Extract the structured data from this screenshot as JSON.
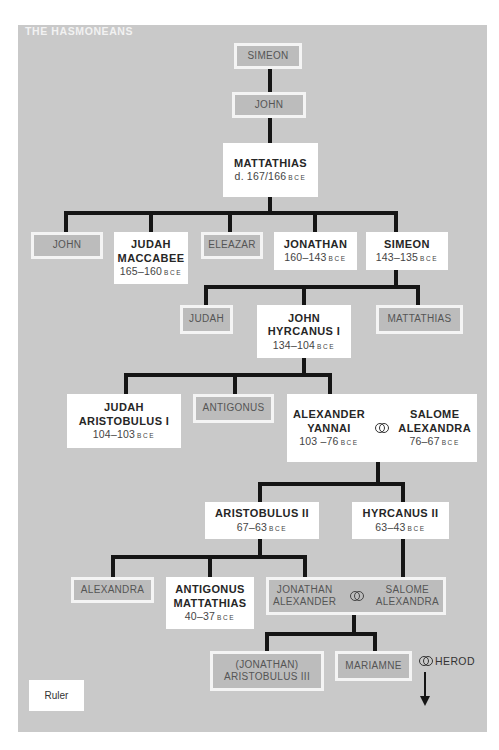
{
  "title": "THE HASMONEANS",
  "era_suffix": "BCE",
  "marriage_symbol": "interlocked-rings",
  "colors": {
    "background": "#c9c9c9",
    "ruler_box": "#ffffff",
    "non_ruler_box": "#bcbcbc",
    "line": "#151515"
  },
  "legend": {
    "ruler_label": "Ruler"
  },
  "nodes": {
    "simeon_top": {
      "name": "SIMEON",
      "ruler": false
    },
    "john_top": {
      "name": "JOHN",
      "ruler": false
    },
    "mattathias": {
      "name": "MATTATHIAS",
      "date": "d. 167/166",
      "ruler": true
    },
    "john_son": {
      "name": "JOHN",
      "ruler": false
    },
    "judah_maccabee": {
      "name1": "JUDAH",
      "name2": "MACCABEE",
      "date": "165–160",
      "ruler": true
    },
    "eleazar": {
      "name": "ELEAZAR",
      "ruler": false
    },
    "jonathan": {
      "name": "JONATHAN",
      "date": "160–143",
      "ruler": true
    },
    "simeon": {
      "name": "SIMEON",
      "date": "143–135",
      "ruler": true
    },
    "judah_son": {
      "name": "JUDAH",
      "ruler": false
    },
    "john_hyrcanus": {
      "name1": "JOHN",
      "name2": "HYRCANUS I",
      "date": "134–104",
      "ruler": true
    },
    "mattathias_son": {
      "name": "MATTATHIAS",
      "ruler": false
    },
    "judah_aristobulus": {
      "name1": "JUDAH",
      "name2": "ARISTOBULUS I",
      "date": "104–103",
      "ruler": true
    },
    "antigonus": {
      "name": "ANTIGONUS",
      "ruler": false
    },
    "alexander_yannai": {
      "name1": "ALEXANDER",
      "name2": "YANNAI",
      "date": "103 –76",
      "ruler": true
    },
    "salome_alexandra": {
      "name1": "SALOME",
      "name2": "ALEXANDRA",
      "date": "76–67",
      "ruler": true
    },
    "aristobulus_ii": {
      "name": "ARISTOBULUS II",
      "date": "67–63",
      "ruler": true
    },
    "hyrcanus_ii": {
      "name": "HYRCANUS II",
      "date": "63–43",
      "ruler": true
    },
    "alexandra": {
      "name": "ALEXANDRA",
      "ruler": false
    },
    "antigonus_mattathias": {
      "name1": "ANTIGONUS",
      "name2": "MATTATHIAS",
      "date": "40–37",
      "ruler": true
    },
    "jonathan_alexander": {
      "name1": "JONATHAN",
      "name2": "ALEXANDER",
      "ruler": false
    },
    "salome_alexandra_2": {
      "name1": "SALOME",
      "name2": "ALEXANDRA",
      "ruler": false
    },
    "aristobulus_iii": {
      "name1": "(JONATHAN)",
      "name2": "ARISTOBULUS III",
      "ruler": false
    },
    "mariamne": {
      "name": "MARIAMNE",
      "ruler": false
    },
    "herod": {
      "name": "HEROD"
    }
  }
}
